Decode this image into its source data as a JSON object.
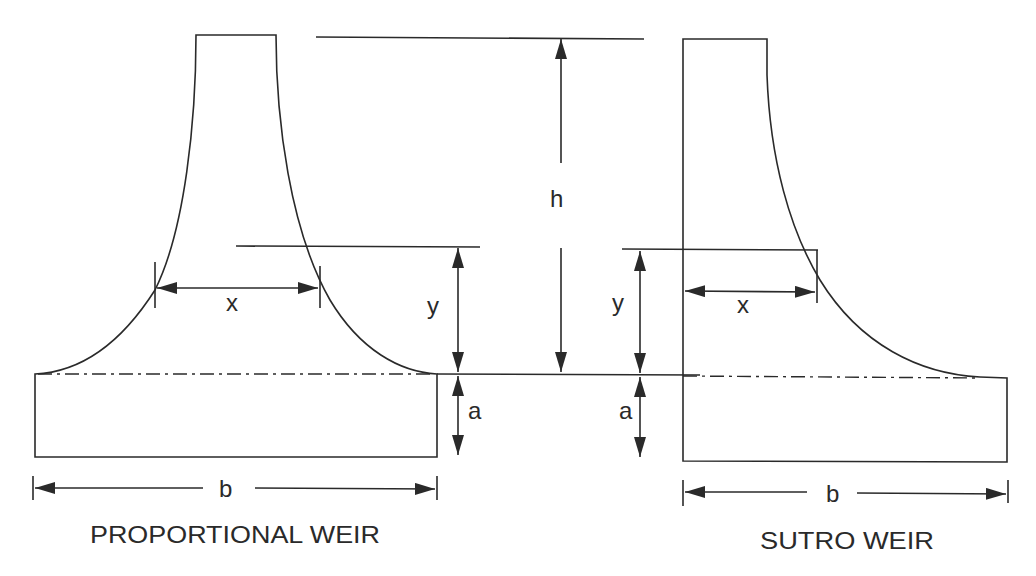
{
  "diagram": {
    "left_figure": {
      "caption": "PROPORTIONAL WEIR",
      "labels": {
        "x": "x",
        "y": "y",
        "a": "a",
        "b": "b"
      }
    },
    "right_figure": {
      "caption": "SUTRO WEIR",
      "labels": {
        "x": "x",
        "y": "y",
        "a": "a",
        "b": "b"
      }
    },
    "shared_labels": {
      "h": "h"
    },
    "colors": {
      "line": "#2a2a2a",
      "background": "#ffffff"
    }
  }
}
